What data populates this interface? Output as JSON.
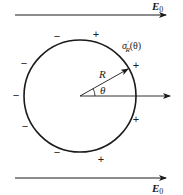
{
  "figure": {
    "field_labels": {
      "top": {
        "symbol": "E",
        "subscript": "0"
      },
      "bottom": {
        "symbol": "E",
        "subscript": "0"
      }
    },
    "circle": {
      "cx": 80,
      "cy": 96,
      "r": 56,
      "stroke": "#1a1a1a"
    },
    "radius_label": "R",
    "angle_label": "θ",
    "surface_charge_label": {
      "sigma": "σ",
      "prime": "′",
      "subscript": "R",
      "arg": "(θ)"
    },
    "charges": [
      {
        "sign": "−",
        "x": 57,
        "y": 40
      },
      {
        "sign": "+",
        "x": 96,
        "y": 38
      },
      {
        "sign": "+",
        "x": 136,
        "y": 69
      },
      {
        "sign": "−",
        "x": 24,
        "y": 67
      },
      {
        "sign": "−",
        "x": 16,
        "y": 99
      },
      {
        "sign": "−",
        "x": 25,
        "y": 130
      },
      {
        "sign": "+",
        "x": 136,
        "y": 123
      },
      {
        "sign": "−",
        "x": 57,
        "y": 156
      },
      {
        "sign": "+",
        "x": 101,
        "y": 163
      }
    ],
    "colors": {
      "ink": "#1a1a1a",
      "background": "#ffffff"
    }
  }
}
